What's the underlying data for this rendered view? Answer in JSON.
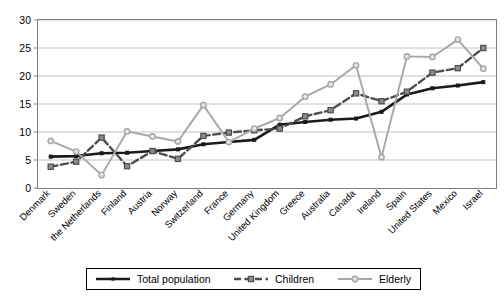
{
  "chart_data": {
    "type": "line",
    "title": "",
    "subtitle": "",
    "xlabel": "",
    "ylabel": "",
    "ylim": [
      0,
      30
    ],
    "yticks": [
      0,
      5,
      10,
      15,
      20,
      25,
      30
    ],
    "ytick_labels": [
      "0",
      "5",
      "10",
      "15",
      "20",
      "25",
      "30"
    ],
    "grid": true,
    "legend_position": "bottom",
    "categories": [
      "Denmark",
      "Sweden",
      "the Netherlands",
      "Finland",
      "Austria",
      "Norway",
      "Switzerland",
      "France",
      "Germany",
      "United Kingdom",
      "Greece",
      "Australia",
      "Canada",
      "Ireland",
      "Spain",
      "United States",
      "Mexico",
      "Israel"
    ],
    "series": [
      {
        "name": "Total population",
        "color": "#1a1a1a",
        "marker": "square-small",
        "dash": "solid",
        "values": [
          5.6,
          5.7,
          6.2,
          6.3,
          6.6,
          6.9,
          7.8,
          8.2,
          8.6,
          11.3,
          11.8,
          12.2,
          12.4,
          13.6,
          16.7,
          17.8,
          18.3,
          18.9
        ]
      },
      {
        "name": "Children",
        "color": "#4d4d4d",
        "marker": "square",
        "dash": "dashed",
        "values": [
          3.8,
          4.7,
          9.0,
          3.9,
          6.6,
          5.2,
          9.3,
          9.9,
          10.3,
          10.6,
          12.8,
          13.9,
          16.9,
          15.5,
          17.2,
          20.6,
          21.4,
          25.0
        ]
      },
      {
        "name": "Elderly",
        "color": "#a6a6a6",
        "marker": "circle",
        "dash": "solid",
        "values": [
          8.4,
          6.5,
          2.3,
          10.1,
          9.2,
          8.3,
          14.8,
          8.2,
          10.6,
          12.5,
          16.3,
          18.5,
          21.9,
          5.5,
          23.5,
          23.4,
          26.5,
          21.3
        ]
      }
    ]
  },
  "legend": {
    "items": [
      {
        "label": "Total population"
      },
      {
        "label": "Children"
      },
      {
        "label": "Elderly"
      }
    ]
  }
}
